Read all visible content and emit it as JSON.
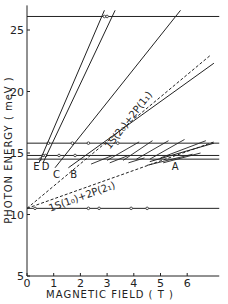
{
  "chart_data": {
    "type": "line",
    "title": "",
    "xlabel": "MAGNETIC FIELD ( T )",
    "ylabel": "PHOTON ENERGY ( meV )",
    "xlim": [
      0,
      7.2
    ],
    "ylim": [
      5,
      27
    ],
    "xticks": [
      0,
      1,
      2,
      3,
      4,
      5,
      6
    ],
    "yticks": [
      5,
      10,
      15,
      20,
      25
    ],
    "grid": false,
    "legend": null,
    "horizontal_lines": [
      {
        "name": "laser-26.1",
        "y": 26.1,
        "markers_x": [
          2.9,
          3.0
        ]
      },
      {
        "name": "laser-15.8",
        "y": 15.8,
        "markers_x": [
          0.8,
          1.7,
          2.3,
          3.4
        ]
      },
      {
        "name": "laser-14.8",
        "y": 14.8,
        "markers_x": [
          0.6,
          0.7,
          1.2,
          1.8
        ]
      },
      {
        "name": "laser-14.5",
        "y": 14.5,
        "markers_x": [
          0.5
        ]
      },
      {
        "name": "laser-10.5",
        "y": 10.5,
        "markers_x": [
          0.3,
          2.3,
          2.7,
          3.9,
          4.5
        ]
      }
    ],
    "series": [
      {
        "name": "E",
        "style": "solid",
        "x": [
          0.45,
          2.9
        ],
        "y": [
          14.2,
          26.6
        ]
      },
      {
        "name": "D",
        "style": "solid",
        "x": [
          0.6,
          3.3
        ],
        "y": [
          14.2,
          26.6
        ]
      },
      {
        "name": "C",
        "style": "solid",
        "x": [
          1.05,
          5.75
        ],
        "y": [
          13.8,
          26.6
        ]
      },
      {
        "name": "B",
        "style": "solid",
        "x": [
          1.55,
          7.0
        ],
        "y": [
          13.8,
          22.3
        ]
      },
      {
        "name": "1S(2₀)+2P(1₁)",
        "style": "dashed",
        "x": [
          0.0,
          6.9
        ],
        "y": [
          10.5,
          23.0
        ]
      },
      {
        "name": "1S(1₀)+2P(2₁)",
        "style": "dashed",
        "x": [
          0.0,
          7.0
        ],
        "y": [
          10.5,
          15.9
        ]
      },
      {
        "name": "A",
        "style": "solid",
        "x": [
          4.6,
          7.0
        ],
        "y": [
          14.3,
          15.8
        ]
      }
    ],
    "short_segments": [
      {
        "x": [
          3.0,
          4.2
        ],
        "y": [
          14.4,
          15.9
        ]
      },
      {
        "x": [
          3.6,
          4.7
        ],
        "y": [
          14.4,
          16.0
        ]
      },
      {
        "x": [
          4.1,
          5.3
        ],
        "y": [
          14.5,
          16.0
        ]
      },
      {
        "x": [
          4.6,
          5.9
        ],
        "y": [
          14.5,
          16.1
        ]
      },
      {
        "x": [
          5.0,
          6.7
        ],
        "y": [
          14.6,
          16.0
        ]
      },
      {
        "x": [
          2.4,
          3.2
        ],
        "y": [
          14.1,
          14.8
        ]
      },
      {
        "x": [
          3.1,
          3.8
        ],
        "y": [
          14.2,
          14.8
        ]
      },
      {
        "x": [
          3.8,
          4.4
        ],
        "y": [
          14.2,
          14.6
        ]
      },
      {
        "x": [
          4.5,
          6.2
        ],
        "y": [
          14.0,
          14.9
        ]
      },
      {
        "x": [
          5.1,
          6.5
        ],
        "y": [
          14.2,
          15.0
        ]
      }
    ],
    "annotations": [
      {
        "text": "E",
        "x": 0.35,
        "y": 13.6
      },
      {
        "text": "D",
        "x": 0.7,
        "y": 13.6
      },
      {
        "text": "C",
        "x": 1.1,
        "y": 13.0
      },
      {
        "text": "B",
        "x": 1.75,
        "y": 13.0
      },
      {
        "text": "A",
        "x": 5.55,
        "y": 13.6
      },
      {
        "text": "1S(2₀)+2P(1₁)",
        "x": 3.9,
        "y": 17.5,
        "rotation": -52
      },
      {
        "text": "1S(1₀)+2P(2₁)",
        "x": 2.1,
        "y": 11.2,
        "rotation": -20
      }
    ]
  }
}
